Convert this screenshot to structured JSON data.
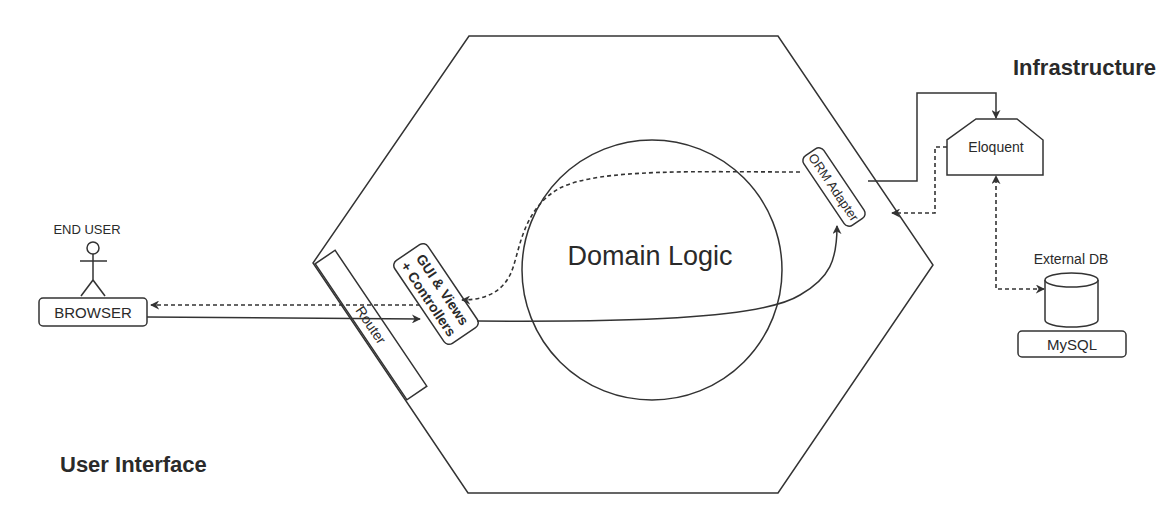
{
  "diagram": {
    "type": "hexagonal-architecture",
    "zones": {
      "infrastructure": "Infrastructure",
      "user_interface": "User Interface"
    },
    "core": {
      "label": "Domain Logic"
    },
    "actor": {
      "label": "END USER",
      "icon": "stick-figure-icon"
    },
    "nodes": {
      "browser": "BROWSER",
      "router": "Router",
      "gui_line1": "GUI & Views",
      "gui_line2": "+ Controllers",
      "orm_adapter": "ORM Adapter",
      "eloquent": "Eloquent",
      "external_db_label": "External DB",
      "mysql": "MySQL"
    },
    "connections": [
      {
        "from": "BROWSER",
        "to": "GUI & Views + Controllers",
        "style": "solid",
        "via": "Router"
      },
      {
        "from": "GUI & Views + Controllers",
        "to": "BROWSER",
        "style": "dashed"
      },
      {
        "from": "GUI & Views + Controllers",
        "to": "ORM Adapter",
        "style": "solid"
      },
      {
        "from": "ORM Adapter",
        "to": "GUI & Views + Controllers",
        "style": "dashed"
      },
      {
        "from": "ORM Adapter",
        "to": "Eloquent",
        "style": "solid"
      },
      {
        "from": "Eloquent",
        "to": "ORM Adapter",
        "style": "dashed"
      },
      {
        "from": "Eloquent",
        "to": "External DB",
        "style": "dashed",
        "bidirectional": true
      }
    ],
    "colors": {
      "stroke": "#333333",
      "text": "#2a2a2a",
      "background": "#ffffff"
    }
  }
}
